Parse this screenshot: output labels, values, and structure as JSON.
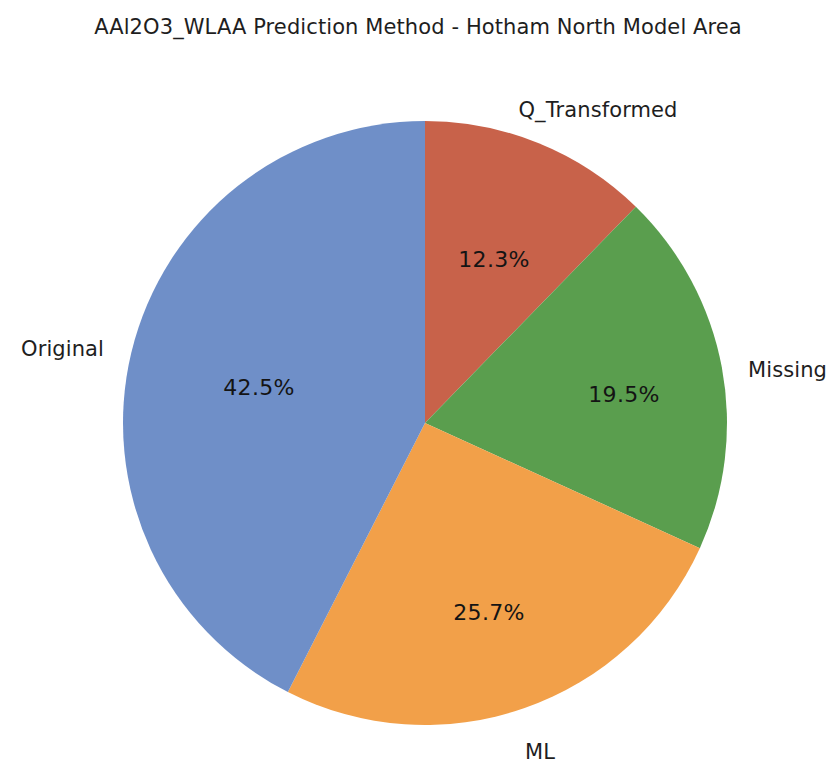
{
  "chart_data": {
    "type": "pie",
    "title": "AAl2O3_WLAA Prediction Method - Hotham North Model Area",
    "xlabel": "",
    "ylabel": "",
    "legend": "none",
    "grid": false,
    "start_angle_deg": 90,
    "direction": "clockwise",
    "categories": [
      "Q_Transformed",
      "Missing",
      "ML",
      "Original"
    ],
    "values": [
      12.3,
      19.5,
      25.7,
      42.5
    ],
    "value_unit": "%",
    "autopct_labels": [
      "12.3%",
      "19.5%",
      "25.7%",
      "42.5%"
    ],
    "colors": [
      "#c8624a",
      "#5a9e4e",
      "#f2a049",
      "#6f8fc8"
    ],
    "slices": [
      {
        "name": "Q_Transformed",
        "value": 12.3,
        "pct_text": "12.3%",
        "color": "#c8624a",
        "label_x": 598,
        "label_y": 110,
        "anchor": "anchor-center",
        "pct_x": 494,
        "pct_y": 259
      },
      {
        "name": "Missing",
        "value": 19.5,
        "pct_text": "19.5%",
        "color": "#5a9e4e",
        "label_x": 748,
        "label_y": 370,
        "anchor": "anchor-right",
        "pct_x": 624,
        "pct_y": 394
      },
      {
        "name": "ML",
        "value": 25.7,
        "pct_text": "25.7%",
        "color": "#f2a049",
        "label_x": 540,
        "label_y": 752,
        "anchor": "anchor-center",
        "pct_x": 489,
        "pct_y": 612
      },
      {
        "name": "Original",
        "value": 42.5,
        "pct_text": "42.5%",
        "color": "#6f8fc8",
        "label_x": 104,
        "label_y": 349,
        "anchor": "anchor-left",
        "pct_x": 259,
        "pct_y": 387
      }
    ],
    "geometry": {
      "center_x": 425,
      "center_y": 423,
      "radius": 302
    }
  }
}
